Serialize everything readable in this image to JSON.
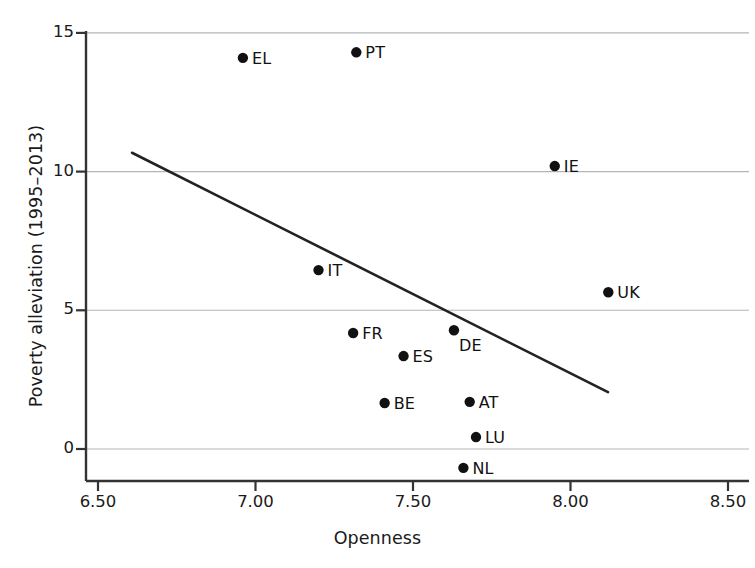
{
  "chart_data": {
    "type": "scatter",
    "title": "",
    "xlabel": "Openness",
    "ylabel": "Poverty alleviation (1995–2013)",
    "xlim": [
      6.5,
      8.5
    ],
    "ylim": [
      -1.15,
      15.6
    ],
    "xticks": [
      "6.50",
      "7.00",
      "7.50",
      "8.00",
      "8.50"
    ],
    "xtick_values": [
      6.5,
      7.0,
      7.5,
      8.0,
      8.5
    ],
    "yticks": [
      "0",
      "5",
      "10",
      "15"
    ],
    "ytick_values": [
      0,
      5,
      10,
      15
    ],
    "grid": "horizontal",
    "legend": "none",
    "point_color": "#111111",
    "line_color": "#222222",
    "grid_color": "#b5b5b5",
    "axis_color": "#333333",
    "points": [
      {
        "label": "EL",
        "x": 6.96,
        "y": 14.1,
        "label_dx": 9,
        "label_dy": -8
      },
      {
        "label": "PT",
        "x": 7.32,
        "y": 14.3,
        "label_dx": 9,
        "label_dy": -8
      },
      {
        "label": "IE",
        "x": 7.95,
        "y": 10.2,
        "label_dx": 9,
        "label_dy": -8
      },
      {
        "label": "IT",
        "x": 7.2,
        "y": 6.45,
        "label_dx": 9,
        "label_dy": -8
      },
      {
        "label": "UK",
        "x": 8.12,
        "y": 5.65,
        "label_dx": 9,
        "label_dy": -8
      },
      {
        "label": "FR",
        "x": 7.31,
        "y": 4.18,
        "label_dx": 9,
        "label_dy": -8
      },
      {
        "label": "DE",
        "x": 7.63,
        "y": 4.28,
        "label_dx": 5,
        "label_dy": 7
      },
      {
        "label": "ES",
        "x": 7.47,
        "y": 3.35,
        "label_dx": 9,
        "label_dy": -8
      },
      {
        "label": "BE",
        "x": 7.41,
        "y": 1.66,
        "label_dx": 9,
        "label_dy": -8
      },
      {
        "label": "AT",
        "x": 7.68,
        "y": 1.7,
        "label_dx": 9,
        "label_dy": -8
      },
      {
        "label": "LU",
        "x": 7.7,
        "y": 0.43,
        "label_dx": 9,
        "label_dy": -8
      },
      {
        "label": "NL",
        "x": 7.66,
        "y": -0.68,
        "label_dx": 9,
        "label_dy": -8
      }
    ],
    "trendline": {
      "x0": 6.608,
      "y0": 10.68,
      "x1": 8.119,
      "y1": 2.05
    }
  }
}
